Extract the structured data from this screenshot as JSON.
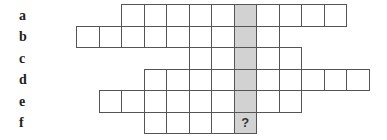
{
  "puzzle": {
    "grid_origin_x": 76,
    "grid_origin_y": 4,
    "cell_width": 22.5,
    "cell_height": 21.5,
    "shaded_column": 7,
    "shaded_color": "#d2d2d2",
    "line_color": "#555555",
    "rows": [
      {
        "label": "a",
        "start_col": 2,
        "end_col": 11,
        "cells": [
          "",
          "",
          "",
          "",
          "",
          "",
          "",
          "",
          "",
          ""
        ]
      },
      {
        "label": "b",
        "start_col": 0,
        "end_col": 8,
        "cells": [
          "",
          "",
          "",
          "",
          "",
          "",
          "",
          "",
          ""
        ]
      },
      {
        "label": "c",
        "start_col": 5,
        "end_col": 9,
        "cells": [
          "",
          "",
          "",
          "",
          ""
        ]
      },
      {
        "label": "d",
        "start_col": 3,
        "end_col": 12,
        "cells": [
          "",
          "",
          "",
          "",
          "",
          "",
          "",
          "",
          "",
          ""
        ]
      },
      {
        "label": "e",
        "start_col": 1,
        "end_col": 9,
        "cells": [
          "",
          "",
          "",
          "",
          "",
          "",
          "",
          "",
          ""
        ]
      },
      {
        "label": "f",
        "start_col": 3,
        "end_col": 7,
        "cells": [
          "",
          "",
          "",
          "",
          "?"
        ]
      }
    ]
  }
}
